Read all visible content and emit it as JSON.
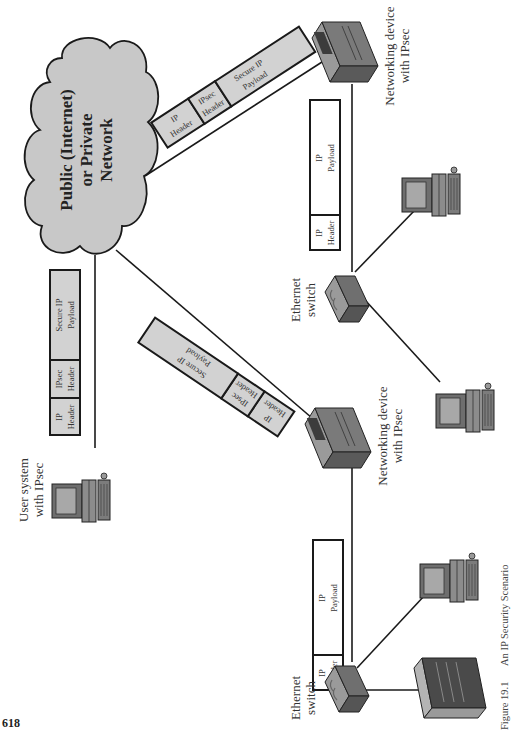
{
  "page": {
    "number": "618",
    "orientation": "rotated 90° counter-clockwise"
  },
  "figure": {
    "number": "Figure 19.1",
    "title": "An IP Security Scenario"
  },
  "network": {
    "line1": "Public (Internet)",
    "line2": "or Private",
    "line3": "Network"
  },
  "nodes": {
    "user_system": {
      "line1": "User system",
      "line2": "with IPsec"
    },
    "net_device_top": {
      "line1": "Networking device",
      "line2": "with IPsec"
    },
    "net_device_bottom": {
      "line1": "Networking device",
      "line2": "with IPsec"
    },
    "switch_top": {
      "line1": "Ethernet",
      "line2": "switch"
    },
    "switch_bottom": {
      "line1": "Ethernet",
      "line2": "switch"
    }
  },
  "packets": {
    "secure": {
      "ip_header": {
        "l1": "IP",
        "l2": "Header"
      },
      "ipsec_header": {
        "l1": "IPsec",
        "l2": "Header"
      },
      "payload": {
        "l1": "Secure IP",
        "l2": "Payload"
      }
    },
    "plain": {
      "ip_header": {
        "l1": "IP",
        "l2": "Header"
      },
      "payload": {
        "l1": "IP",
        "l2": "Payload"
      }
    }
  },
  "colors": {
    "cloud_fill": "#c8c8c8",
    "secure_packet_fill": "#d2d2d2",
    "plain_packet_fill": "#ffffff",
    "device_body": "#8a8a8a",
    "device_dark": "#5a5a5a",
    "stroke": "#1a1a1a"
  }
}
